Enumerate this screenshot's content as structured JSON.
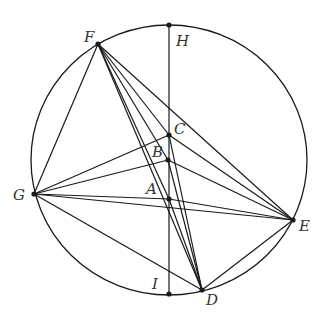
{
  "diagram": {
    "type": "geometry",
    "circle": {
      "cx": 169,
      "cy": 160,
      "rx": 138,
      "ry": 135
    },
    "points": {
      "H": {
        "x": 169,
        "y": 25,
        "label": "H",
        "lx": 176,
        "ly": 34
      },
      "I": {
        "x": 169,
        "y": 294,
        "label": "I",
        "lx": 152,
        "ly": 277
      },
      "F": {
        "x": 98,
        "y": 44,
        "label": "F",
        "lx": 84,
        "ly": 30
      },
      "G": {
        "x": 34,
        "y": 194,
        "label": "G",
        "lx": 13,
        "ly": 188
      },
      "E": {
        "x": 293,
        "y": 220,
        "label": "E",
        "lx": 299,
        "ly": 219
      },
      "D": {
        "x": 202,
        "y": 290,
        "label": "D",
        "lx": 206,
        "ly": 293
      },
      "C": {
        "x": 169,
        "y": 135,
        "label": "C",
        "lx": 174,
        "ly": 122
      },
      "B": {
        "x": 168,
        "y": 160,
        "label": "B",
        "lx": 152,
        "ly": 145
      },
      "A": {
        "x": 169,
        "y": 199,
        "label": "A",
        "lx": 146,
        "ly": 182
      }
    },
    "segments": [
      [
        "H",
        "I"
      ],
      [
        "F",
        "G"
      ],
      [
        "F",
        "E"
      ],
      [
        "F",
        "C"
      ],
      [
        "F",
        "B"
      ],
      [
        "F",
        "A"
      ],
      [
        "F",
        "D"
      ],
      [
        "G",
        "C"
      ],
      [
        "G",
        "B"
      ],
      [
        "G",
        "A"
      ],
      [
        "G",
        "E"
      ],
      [
        "G",
        "D"
      ],
      [
        "C",
        "E"
      ],
      [
        "B",
        "E"
      ],
      [
        "A",
        "E"
      ],
      [
        "E",
        "D"
      ],
      [
        "C",
        "D"
      ],
      [
        "B",
        "D"
      ],
      [
        "A",
        "D"
      ]
    ],
    "dots": [
      "H",
      "I",
      "F",
      "G",
      "E",
      "D",
      "C",
      "B",
      "A"
    ],
    "stroke_color": "#1a1a1a"
  }
}
